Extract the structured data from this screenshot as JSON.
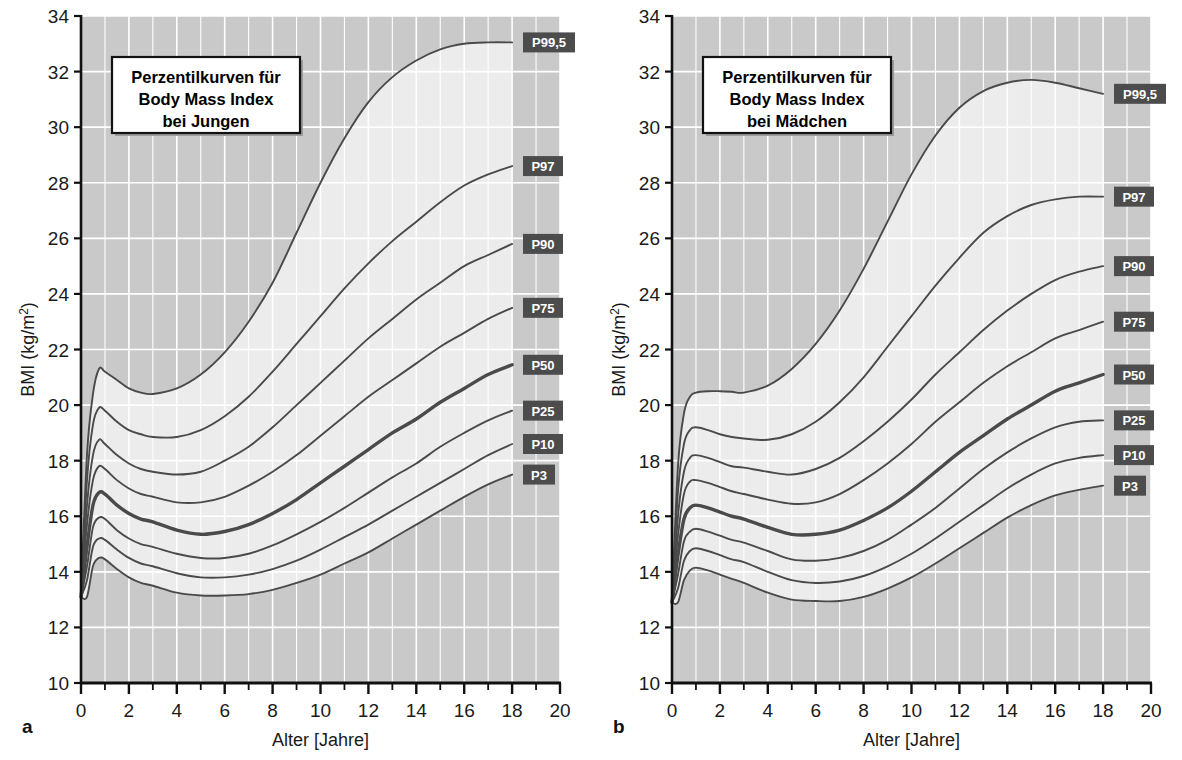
{
  "figure": {
    "background": "#ffffff",
    "plot_fill_outer": "#c9c9c9",
    "plot_fill_inner": "#ececec",
    "grid_color": "#ffffff",
    "axis_color": "#101010",
    "curve_color": "#4a4a4a",
    "curve_color_median": "#4a4a4a",
    "badge_color": "#4c4c4c",
    "badge_text_color": "#ffffff"
  },
  "panels": [
    {
      "letter": "a",
      "title_lines": [
        "Perzentilkurven für",
        "Body Mass Index",
        "bei Jungen"
      ],
      "xlabel": "Alter  [Jahre]",
      "ylabel_main": "BMI (kg/m",
      "ylabel_sup": "2",
      "ylabel_tail": ")"
    },
    {
      "letter": "b",
      "title_lines": [
        "Perzentilkurven für",
        "Body Mass Index",
        "bei Mädchen"
      ],
      "xlabel": "Alter  [Jahre]",
      "ylabel_main": "BMI (kg/m",
      "ylabel_sup": "2",
      "ylabel_tail": ")"
    }
  ],
  "chart_data": [
    {
      "type": "line",
      "title": "Perzentilkurven für Body Mass Index bei Jungen",
      "panel": "a",
      "xlabel": "Alter [Jahre]",
      "ylabel": "BMI (kg/m2)",
      "xlim": [
        0,
        20
      ],
      "ylim": [
        10,
        34
      ],
      "xticks": [
        0,
        2,
        4,
        6,
        8,
        10,
        12,
        14,
        16,
        18,
        20
      ],
      "yticks": [
        10,
        12,
        14,
        16,
        18,
        20,
        22,
        24,
        26,
        28,
        30,
        32,
        34
      ],
      "xtick_minor_step": 1,
      "grid": true,
      "legend": "right-edge-badges",
      "x": [
        0,
        0.25,
        0.5,
        0.75,
        1,
        1.5,
        2,
        2.5,
        3,
        4,
        5,
        6,
        7,
        8,
        9,
        10,
        11,
        12,
        13,
        14,
        15,
        16,
        17,
        18
      ],
      "series": [
        {
          "name": "P99,5",
          "label": "P99,5",
          "values": [
            13.1,
            18.2,
            20.4,
            21.3,
            21.2,
            20.9,
            20.6,
            20.45,
            20.4,
            20.6,
            21.1,
            21.9,
            23.0,
            24.4,
            26.2,
            28.0,
            29.6,
            30.9,
            31.8,
            32.4,
            32.8,
            33.0,
            33.05,
            33.05
          ]
        },
        {
          "name": "P97",
          "label": "P97",
          "values": [
            13.1,
            17.3,
            19.3,
            19.9,
            19.8,
            19.4,
            19.1,
            18.95,
            18.85,
            18.85,
            19.1,
            19.6,
            20.3,
            21.2,
            22.2,
            23.2,
            24.2,
            25.1,
            25.9,
            26.6,
            27.3,
            27.9,
            28.3,
            28.6
          ]
        },
        {
          "name": "P90",
          "label": "P90",
          "values": [
            13.1,
            16.4,
            18.2,
            18.75,
            18.6,
            18.2,
            17.9,
            17.7,
            17.6,
            17.5,
            17.6,
            18.0,
            18.5,
            19.2,
            20.0,
            20.8,
            21.6,
            22.4,
            23.1,
            23.8,
            24.4,
            25.0,
            25.4,
            25.8
          ]
        },
        {
          "name": "P75",
          "label": "P75",
          "values": [
            13.1,
            15.7,
            17.3,
            17.8,
            17.7,
            17.3,
            17.0,
            16.8,
            16.7,
            16.5,
            16.5,
            16.7,
            17.1,
            17.6,
            18.2,
            18.9,
            19.6,
            20.3,
            20.9,
            21.5,
            22.1,
            22.6,
            23.1,
            23.5
          ]
        },
        {
          "name": "P50",
          "label": "P50",
          "values": [
            13.1,
            14.9,
            16.4,
            16.85,
            16.8,
            16.4,
            16.1,
            15.9,
            15.8,
            15.5,
            15.35,
            15.45,
            15.7,
            16.1,
            16.6,
            17.2,
            17.8,
            18.4,
            19.0,
            19.5,
            20.1,
            20.6,
            21.1,
            21.45
          ]
        },
        {
          "name": "P25",
          "label": "P25",
          "values": [
            13.1,
            14.2,
            15.6,
            15.95,
            15.9,
            15.5,
            15.2,
            15.0,
            14.9,
            14.65,
            14.5,
            14.5,
            14.65,
            14.95,
            15.35,
            15.8,
            16.3,
            16.85,
            17.4,
            17.9,
            18.5,
            19.0,
            19.45,
            19.8
          ]
        },
        {
          "name": "P10",
          "label": "P10",
          "values": [
            13.1,
            13.7,
            14.9,
            15.2,
            15.15,
            14.8,
            14.5,
            14.3,
            14.2,
            13.95,
            13.8,
            13.8,
            13.9,
            14.1,
            14.4,
            14.8,
            15.25,
            15.7,
            16.2,
            16.7,
            17.2,
            17.7,
            18.2,
            18.6
          ]
        },
        {
          "name": "P3",
          "label": "P3",
          "values": [
            13.1,
            13.1,
            14.2,
            14.5,
            14.45,
            14.1,
            13.8,
            13.6,
            13.5,
            13.25,
            13.15,
            13.15,
            13.2,
            13.35,
            13.6,
            13.9,
            14.3,
            14.7,
            15.2,
            15.7,
            16.2,
            16.7,
            17.15,
            17.5
          ]
        }
      ]
    },
    {
      "type": "line",
      "title": "Perzentilkurven für Body Mass Index bei Mädchen",
      "panel": "b",
      "xlabel": "Alter [Jahre]",
      "ylabel": "BMI (kg/m2)",
      "xlim": [
        0,
        20
      ],
      "ylim": [
        10,
        34
      ],
      "xticks": [
        0,
        2,
        4,
        6,
        8,
        10,
        12,
        14,
        16,
        18,
        20
      ],
      "yticks": [
        10,
        12,
        14,
        16,
        18,
        20,
        22,
        24,
        26,
        28,
        30,
        32,
        34
      ],
      "xtick_minor_step": 1,
      "grid": true,
      "legend": "right-edge-badges",
      "x": [
        0,
        0.25,
        0.5,
        0.75,
        1,
        1.5,
        2,
        2.5,
        3,
        4,
        5,
        6,
        7,
        8,
        9,
        10,
        11,
        12,
        13,
        14,
        15,
        16,
        17,
        18
      ],
      "series": [
        {
          "name": "P99,5",
          "label": "P99,5",
          "values": [
            12.9,
            17.8,
            19.7,
            20.3,
            20.45,
            20.5,
            20.5,
            20.48,
            20.45,
            20.7,
            21.3,
            22.2,
            23.4,
            24.9,
            26.6,
            28.3,
            29.7,
            30.7,
            31.3,
            31.6,
            31.7,
            31.6,
            31.4,
            31.2
          ]
        },
        {
          "name": "P97",
          "label": "P97",
          "values": [
            12.9,
            16.9,
            18.6,
            19.1,
            19.2,
            19.1,
            18.95,
            18.85,
            18.8,
            18.75,
            18.95,
            19.4,
            20.1,
            21.0,
            22.1,
            23.2,
            24.3,
            25.3,
            26.2,
            26.8,
            27.2,
            27.4,
            27.5,
            27.5
          ]
        },
        {
          "name": "P90",
          "label": "P90",
          "values": [
            12.9,
            16.0,
            17.6,
            18.1,
            18.2,
            18.1,
            17.95,
            17.8,
            17.75,
            17.6,
            17.5,
            17.7,
            18.1,
            18.7,
            19.4,
            20.2,
            21.1,
            21.9,
            22.7,
            23.4,
            24.0,
            24.5,
            24.8,
            25.0
          ]
        },
        {
          "name": "P75",
          "label": "P75",
          "values": [
            12.9,
            15.3,
            16.8,
            17.25,
            17.3,
            17.2,
            17.05,
            16.9,
            16.8,
            16.6,
            16.45,
            16.5,
            16.8,
            17.3,
            17.9,
            18.6,
            19.4,
            20.1,
            20.8,
            21.4,
            21.9,
            22.4,
            22.7,
            23.0
          ]
        },
        {
          "name": "P50",
          "label": "P50",
          "values": [
            12.9,
            14.6,
            15.9,
            16.3,
            16.4,
            16.3,
            16.15,
            16.0,
            15.9,
            15.6,
            15.35,
            15.35,
            15.5,
            15.85,
            16.3,
            16.9,
            17.6,
            18.3,
            18.9,
            19.5,
            20.0,
            20.5,
            20.8,
            21.1
          ]
        },
        {
          "name": "P25",
          "label": "P25",
          "values": [
            12.9,
            13.9,
            15.1,
            15.45,
            15.55,
            15.45,
            15.3,
            15.15,
            15.05,
            14.75,
            14.45,
            14.4,
            14.5,
            14.75,
            15.15,
            15.7,
            16.3,
            17.0,
            17.7,
            18.3,
            18.8,
            19.2,
            19.4,
            19.45
          ]
        },
        {
          "name": "P10",
          "label": "P10",
          "values": [
            12.9,
            13.4,
            14.4,
            14.75,
            14.85,
            14.75,
            14.6,
            14.45,
            14.35,
            14.0,
            13.7,
            13.6,
            13.65,
            13.85,
            14.2,
            14.65,
            15.2,
            15.8,
            16.4,
            17.0,
            17.5,
            17.9,
            18.1,
            18.2
          ]
        },
        {
          "name": "P3",
          "label": "P3",
          "values": [
            12.9,
            12.9,
            13.7,
            14.05,
            14.15,
            14.05,
            13.9,
            13.75,
            13.6,
            13.25,
            13.0,
            12.95,
            12.95,
            13.1,
            13.4,
            13.8,
            14.3,
            14.85,
            15.4,
            15.95,
            16.4,
            16.75,
            16.95,
            17.1
          ]
        }
      ]
    }
  ]
}
